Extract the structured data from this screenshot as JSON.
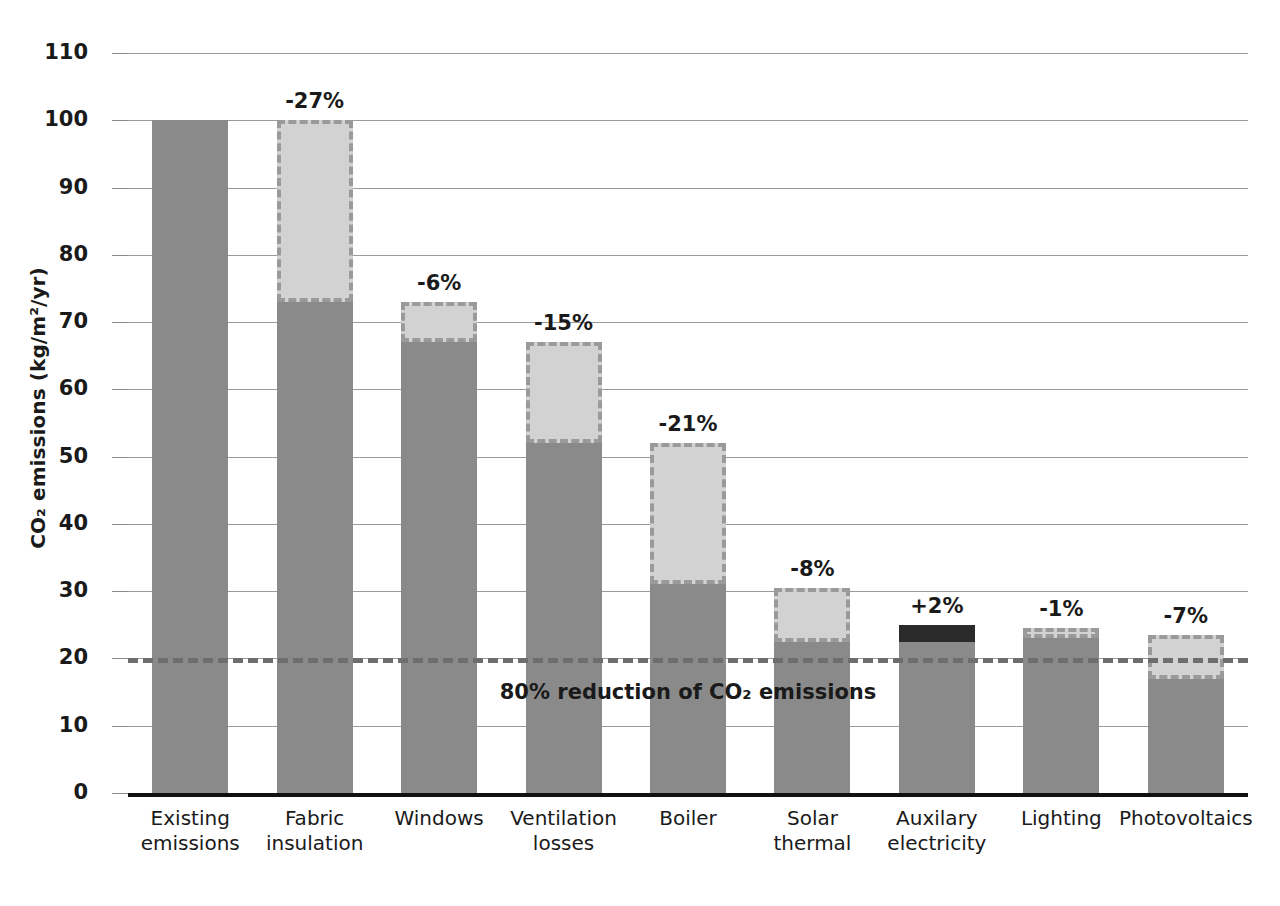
{
  "chart_data": {
    "type": "bar",
    "subtype": "waterfall",
    "title": "",
    "xlabel": "",
    "ylabel": "CO₂ emissions (kg/m²/yr)",
    "ylim": [
      0,
      110
    ],
    "yticks": [
      0,
      10,
      20,
      30,
      40,
      50,
      60,
      70,
      80,
      90,
      100,
      110
    ],
    "ytick_labels": [
      "0",
      "10",
      "20",
      "30",
      "40",
      "50",
      "60",
      "70",
      "80",
      "90",
      "100",
      "110"
    ],
    "grid": true,
    "legend": "none",
    "categories": [
      "Existing emissions",
      "Fabric insulation",
      "Windows",
      "Ventilation losses",
      "Boiler",
      "Solar thermal",
      "Auxilary electricity",
      "Lighting",
      "Photovoltaics"
    ],
    "category_lines": [
      [
        "Existing",
        "emissions"
      ],
      [
        "Fabric",
        "insulation"
      ],
      [
        "Windows"
      ],
      [
        "Ventilation",
        "losses"
      ],
      [
        "Boiler"
      ],
      [
        "Solar",
        "thermal"
      ],
      [
        "Auxilary",
        "electricity"
      ],
      [
        "Lighting"
      ],
      [
        "Photovoltaics"
      ]
    ],
    "bars": [
      {
        "category": "Existing emissions",
        "base": 0,
        "top": 100,
        "delta": null,
        "label": "",
        "direction": "none"
      },
      {
        "category": "Fabric insulation",
        "base": 73,
        "top": 100,
        "delta": -27,
        "label": "-27%",
        "direction": "decrease"
      },
      {
        "category": "Windows",
        "base": 67,
        "top": 73,
        "delta": -6,
        "label": "-6%",
        "direction": "decrease"
      },
      {
        "category": "Ventilation losses",
        "base": 52,
        "top": 67,
        "delta": -15,
        "label": "-15%",
        "direction": "decrease"
      },
      {
        "category": "Boiler",
        "base": 31,
        "top": 52,
        "delta": -21,
        "label": "-21%",
        "direction": "decrease"
      },
      {
        "category": "Solar thermal",
        "base": 22.5,
        "top": 30.5,
        "delta": -8,
        "label": "-8%",
        "direction": "decrease"
      },
      {
        "category": "Auxilary electricity",
        "base": 22.5,
        "top": 25,
        "delta": 2,
        "label": "+2%",
        "direction": "increase"
      },
      {
        "category": "Lighting",
        "base": 23,
        "top": 24.5,
        "delta": -1,
        "label": "-1%",
        "direction": "decrease"
      },
      {
        "category": "Photovoltaics",
        "base": 17,
        "top": 23.5,
        "delta": -7,
        "label": "-7%",
        "direction": "decrease"
      }
    ],
    "reference_line": {
      "value": 20,
      "label": "80% reduction of CO₂ emissions",
      "style": "dashed"
    },
    "colors": {
      "bar_base": "#8a8a8a",
      "bar_decrease": "#d2d2d2",
      "bar_decrease_border": "#9a9a9a",
      "bar_increase": "#2b2b2b",
      "gridline": "#9b9b9b",
      "axis": "#111111",
      "reference_line": "#6e6e6e",
      "text": "#1a1a1a",
      "background": "#ffffff"
    }
  }
}
